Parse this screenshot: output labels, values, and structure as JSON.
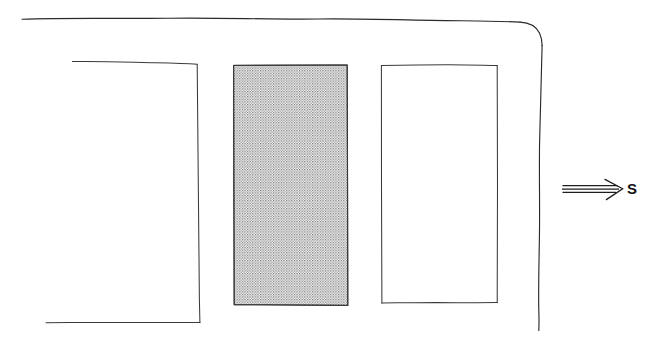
{
  "figure": {
    "canvas": {
      "width": 662,
      "height": 340
    },
    "colors": {
      "background": "#ffffff",
      "ink": "#2b2b2b",
      "ink_soft": "#3a3a3a",
      "stipple": "#7a7a7a",
      "label": "#111111"
    }
  },
  "boundary": {
    "name": "outer wall",
    "top_edge": {
      "x1": 22,
      "y1": 19,
      "x2": 520,
      "y2": 22
    },
    "corner": {
      "type": "rounded",
      "radius": 24,
      "position": "top-right"
    },
    "right_edge": {
      "x1": 542,
      "y1": 45,
      "x2": 539,
      "y2": 330
    }
  },
  "bays": [
    {
      "id": "bay-left",
      "label": "left bay",
      "fill": "none",
      "open_side": "left",
      "rect": {
        "x": 45,
        "y": 62,
        "width": 154,
        "height": 260
      }
    },
    {
      "id": "bay-centre",
      "label": "centre bay",
      "fill": "stipple",
      "open_side": "none",
      "rect": {
        "x": 233,
        "y": 65,
        "width": 114,
        "height": 240
      }
    },
    {
      "id": "bay-right",
      "label": "right bay",
      "fill": "none",
      "open_side": "none",
      "rect": {
        "x": 381,
        "y": 65,
        "width": 116,
        "height": 238
      }
    }
  ],
  "annotation": {
    "arrow": {
      "name": "direction-arrow",
      "style": "triple-line with open chevron head",
      "direction": "right",
      "line_count": 3,
      "tail_x": 562,
      "head_x": 622,
      "y": 189
    },
    "label": {
      "text": "S",
      "x": 628,
      "y": 180
    }
  }
}
